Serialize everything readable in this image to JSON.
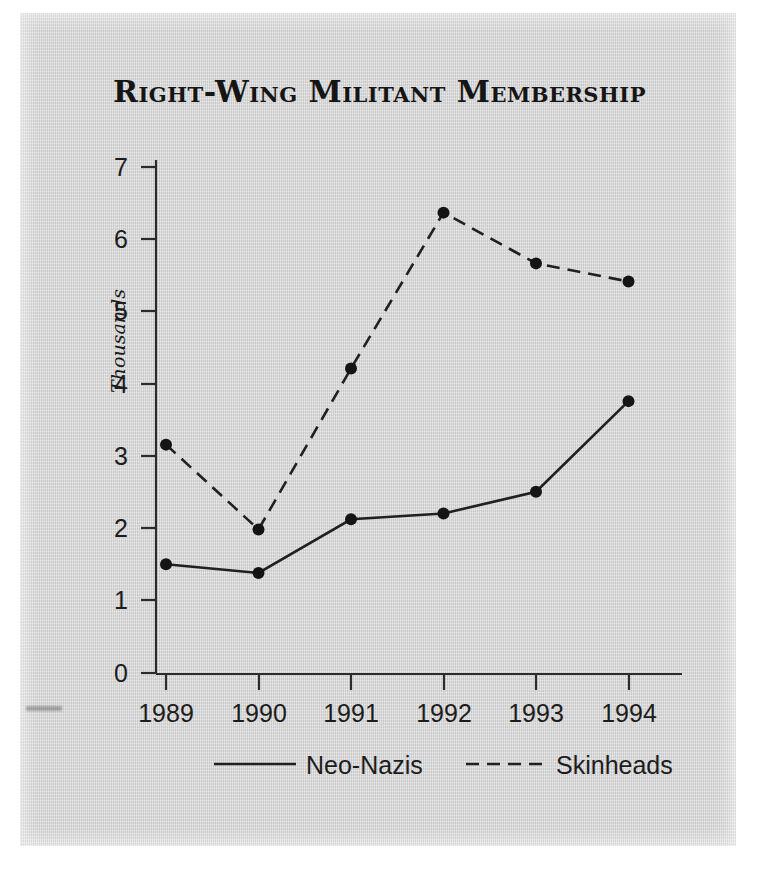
{
  "figure": {
    "title": "Right-Wing Militant Membership",
    "background_color": "#d3d3d3",
    "ink_color": "#202020"
  },
  "axes": {
    "y_title": "Thousands",
    "y_ticks": [
      "0",
      "1",
      "2",
      "3",
      "4",
      "5",
      "6",
      "7"
    ],
    "x_ticks": [
      "1989",
      "1990",
      "1991",
      "1992",
      "1993",
      "1994"
    ]
  },
  "legend": {
    "entries": [
      {
        "label": "Neo-Nazis",
        "style": "solid"
      },
      {
        "label": "Skinheads",
        "style": "dashed"
      }
    ]
  },
  "chart_data": {
    "type": "line",
    "title": "Right-Wing Militant Membership",
    "subtitle": "",
    "xlabel": "",
    "ylabel": "Thousands",
    "categories": [
      "1989",
      "1990",
      "1991",
      "1992",
      "1993",
      "1994"
    ],
    "x": [
      1989,
      1990,
      1991,
      1992,
      1993,
      1994
    ],
    "series": [
      {
        "name": "Neo-Nazis",
        "style": "solid",
        "marker": "filled-circle",
        "values": [
          1.5,
          1.38,
          2.12,
          2.2,
          2.5,
          3.75
        ]
      },
      {
        "name": "Skinheads",
        "style": "dashed",
        "marker": "filled-circle",
        "values": [
          3.15,
          1.98,
          4.2,
          6.35,
          5.65,
          5.4
        ]
      }
    ],
    "ylim": [
      0,
      7
    ],
    "ytick_values": [
      0,
      1,
      2,
      3,
      4,
      5,
      6,
      7
    ],
    "grid": false,
    "legend_position": "bottom",
    "units": "thousands of members",
    "annotations": []
  }
}
